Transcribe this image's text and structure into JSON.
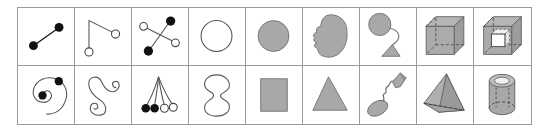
{
  "figure": {
    "type": "shape-taxonomy-grid",
    "background_color": "#ffffff",
    "border_color": "#9a9a9a",
    "fill_gray": "#a8a8a8",
    "stroke_dark": "#1a1a1a",
    "rows": 2,
    "columns": 9,
    "cells": [
      {
        "index": 1,
        "row": 1,
        "column": 1,
        "name": "line-with-two-filled-dots",
        "label": "segment with two filled endpoint dots",
        "markers": "filled, filled",
        "fill": "none"
      },
      {
        "index": 2,
        "row": 1,
        "column": 2,
        "name": "bent-line-two-open-dots",
        "label": "bent polyline with two open endpoint circles",
        "markers": "open, open",
        "fill": "none"
      },
      {
        "index": 3,
        "row": 1,
        "column": 3,
        "name": "cross-four-dots",
        "label": "X cross with two filled and two open dots",
        "markers": "filled, filled, open, open",
        "fill": "none"
      },
      {
        "index": 4,
        "row": 1,
        "column": 4,
        "name": "circle-outline",
        "label": "circle outline",
        "markers": "none",
        "fill": "none"
      },
      {
        "index": 5,
        "row": 1,
        "column": 5,
        "name": "circle-filled",
        "label": "solid gray circle",
        "markers": "none",
        "fill": "gray"
      },
      {
        "index": 6,
        "row": 1,
        "column": 6,
        "name": "irregular-blob",
        "label": "irregular gray blob",
        "markers": "none",
        "fill": "gray"
      },
      {
        "index": 7,
        "row": 1,
        "column": 7,
        "name": "circle-with-stem-and-base",
        "label": "gray circle joined by curved stem to triangular base",
        "markers": "none",
        "fill": "gray"
      },
      {
        "index": 8,
        "row": 1,
        "column": 8,
        "name": "wireframe-cube",
        "label": "gray cube with dashed hidden edges",
        "markers": "none",
        "fill": "gray"
      },
      {
        "index": 9,
        "row": 1,
        "column": 9,
        "name": "cube-with-inner-cube",
        "label": "gray cube containing a smaller hollow cube",
        "markers": "none",
        "fill": "gray"
      },
      {
        "index": 10,
        "row": 2,
        "column": 1,
        "name": "spiral-two-filled-dots",
        "label": "spiral with filled dot at center and at outer end",
        "markers": "filled, filled",
        "fill": "none"
      },
      {
        "index": 11,
        "row": 2,
        "column": 2,
        "name": "s-curve-two-curls",
        "label": "S curve with small curled loops at both ends",
        "markers": "none",
        "fill": "none"
      },
      {
        "index": 12,
        "row": 2,
        "column": 3,
        "name": "fan-four-dots",
        "label": "fan of four strands: two filled and two open dots",
        "markers": "filled, filled, open, open",
        "fill": "none"
      },
      {
        "index": 13,
        "row": 2,
        "column": 4,
        "name": "hourglass-outline",
        "label": "peanut / hourglass outline",
        "markers": "none",
        "fill": "none"
      },
      {
        "index": 14,
        "row": 2,
        "column": 5,
        "name": "rectangle-filled",
        "label": "solid gray rectangle",
        "markers": "none",
        "fill": "gray"
      },
      {
        "index": 15,
        "row": 2,
        "column": 6,
        "name": "triangle-filled",
        "label": "solid gray triangle",
        "markers": "none",
        "fill": "gray"
      },
      {
        "index": 16,
        "row": 2,
        "column": 7,
        "name": "ellipse-wavy-tail-kite",
        "label": "gray ellipse joined by wavy line to arrow-kite shape",
        "markers": "none",
        "fill": "gray"
      },
      {
        "index": 17,
        "row": 2,
        "column": 8,
        "name": "tetrahedron",
        "label": "gray tetrahedron with dashed hidden edge",
        "markers": "none",
        "fill": "gray"
      },
      {
        "index": 18,
        "row": 2,
        "column": 9,
        "name": "cylinder",
        "label": "gray cylinder with dashed hidden base",
        "markers": "none",
        "fill": "gray"
      }
    ]
  }
}
